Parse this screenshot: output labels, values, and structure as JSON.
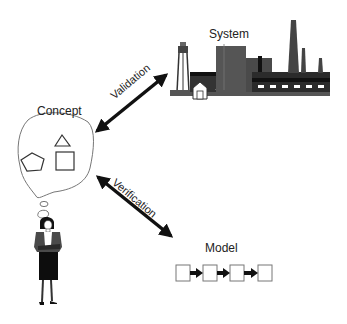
{
  "nodes": {
    "system": {
      "label": "System"
    },
    "concept": {
      "label": "Concept"
    },
    "model": {
      "label": "Model"
    }
  },
  "edges": {
    "validation": {
      "label": "Validation",
      "from": "concept",
      "to": "system",
      "bidirectional": true
    },
    "verification": {
      "label": "Verification",
      "from": "concept",
      "to": "model",
      "bidirectional": true
    }
  },
  "icons": {
    "system": "factory-icon",
    "concept": "thought-bubble-icon",
    "person": "person-icon",
    "model": "process-chain-icon"
  },
  "colors": {
    "arrow": "#111111",
    "factory": "#555555",
    "factory_dark": "#1a1a1a",
    "outline": "#555555"
  }
}
